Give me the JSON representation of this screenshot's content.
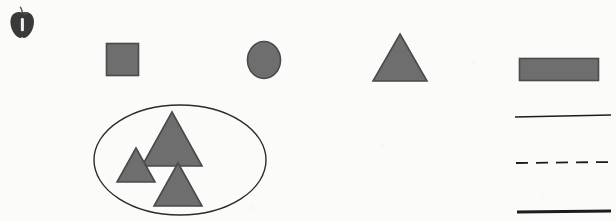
{
  "page": {
    "kind": "geometry-shapes-worksheet",
    "width": 616,
    "height": 221,
    "background_color": "#fbfbfa",
    "scan_artifacts": true
  },
  "palette": {
    "shape_fill": "#6e6e6e",
    "shape_stroke": "#4a4a4a",
    "line_color": "#1c1c1c",
    "ellipse_stroke": "#2b2b2b",
    "apple_body": "#3a3a3a",
    "apple_highlight": "#f2f2f0",
    "apple_stem": "#555555",
    "background": "#fbfbfa"
  },
  "decorations": [
    {
      "name": "apple-icon",
      "label": "apple",
      "x": 10,
      "y": 10,
      "width": 24,
      "height": 30
    }
  ],
  "shapes": [
    {
      "name": "shape-square",
      "label": "square",
      "type": "rect",
      "x": 106,
      "y": 43,
      "width": 33,
      "height": 33,
      "fill": "#6e6e6e",
      "stroke": "#4a4a4a"
    },
    {
      "name": "shape-circle",
      "label": "circle",
      "type": "ellipse",
      "cx": 264,
      "cy": 60,
      "rx": 17,
      "ry": 19,
      "fill": "#6e6e6e",
      "stroke": "#4a4a4a"
    },
    {
      "name": "shape-triangle",
      "label": "triangle",
      "type": "triangle",
      "apex_x": 400,
      "top_y": 34,
      "base_y": 81,
      "half_base": 27,
      "fill": "#6e6e6e",
      "stroke": "#4a4a4a"
    },
    {
      "name": "shape-rectangle",
      "label": "rectangle",
      "type": "rect",
      "x": 519,
      "y": 58,
      "width": 80,
      "height": 23,
      "fill": "#6e6e6e",
      "stroke": "#4a4a4a"
    }
  ],
  "grouped_set": {
    "name": "triangle-group",
    "label": "set of triangles in an ellipse",
    "ellipse": {
      "name": "grouping-ellipse",
      "cx": 180,
      "cy": 160,
      "rx": 86,
      "ry": 55,
      "stroke": "#2b2b2b",
      "stroke_width": 1.4,
      "fill": "none"
    },
    "members": [
      {
        "name": "group-triangle-large",
        "label": "large triangle",
        "apex_x": 172,
        "top_y": 112,
        "base_y": 166,
        "half_base": 30,
        "fill": "#6e6e6e",
        "stroke": "#4a4a4a"
      },
      {
        "name": "group-triangle-small",
        "label": "small triangle",
        "apex_x": 136,
        "top_y": 148,
        "base_y": 182,
        "half_base": 19,
        "fill": "#6e6e6e",
        "stroke": "#4a4a4a"
      },
      {
        "name": "group-triangle-medium",
        "label": "medium triangle",
        "apex_x": 178,
        "top_y": 163,
        "base_y": 206,
        "half_base": 24,
        "fill": "#6e6e6e",
        "stroke": "#4a4a4a"
      }
    ]
  },
  "lines": [
    {
      "name": "line-solid-thin",
      "label": "solid line",
      "style": "solid",
      "x1": 515,
      "y1": 117,
      "x2": 611,
      "y2": 115,
      "stroke": "#1c1c1c",
      "stroke_width": 1.6
    },
    {
      "name": "line-dashed",
      "label": "dashed line",
      "style": "dashed",
      "x1": 516,
      "y1": 163,
      "x2": 611,
      "y2": 162,
      "stroke": "#1c1c1c",
      "stroke_width": 1.8,
      "dash_pattern": "12 8"
    },
    {
      "name": "line-solid-thick",
      "label": "thick solid line",
      "style": "solid",
      "x1": 517,
      "y1": 212,
      "x2": 611,
      "y2": 211,
      "stroke": "#1c1c1c",
      "stroke_width": 3.2
    }
  ]
}
